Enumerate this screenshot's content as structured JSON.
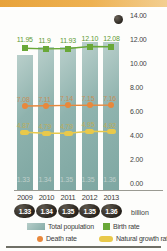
{
  "chart_data": {
    "type": "bar",
    "title": "",
    "xlabel": "",
    "ylabel": "",
    "ylim": [
      0,
      14
    ],
    "grid": false,
    "legend_position": "bottom",
    "categories": [
      "2009",
      "2010",
      "2011",
      "2012",
      "2013"
    ],
    "yticks": [
      "0.00",
      "2.00",
      "4.00",
      "6.00",
      "8.00",
      "10.00",
      "12.00",
      "14.00"
    ],
    "series": [
      {
        "name": "Total population",
        "type": "bar",
        "unit": "billion",
        "values": [
          1.33,
          1.34,
          1.35,
          1.35,
          1.36
        ],
        "labels": [
          "1.33",
          "1.34",
          "1.35",
          "1.35",
          "1.36"
        ]
      },
      {
        "name": "Birth rate",
        "type": "line",
        "values": [
          11.95,
          11.9,
          11.93,
          12.1,
          12.08
        ],
        "labels": [
          "11.95",
          "11.9",
          "11.93",
          "12.10",
          "12.08"
        ]
      },
      {
        "name": "Death rate",
        "type": "line",
        "values": [
          7.08,
          7.11,
          7.14,
          7.15,
          7.16
        ],
        "labels": [
          "7.08",
          "7.11",
          "7.14",
          "7.15",
          "7.16"
        ]
      },
      {
        "name": "Natural growth rate",
        "type": "line",
        "values": [
          4.87,
          4.79,
          4.79,
          4.95,
          4.92
        ],
        "labels": [
          "4.87",
          "4.79",
          "4.79",
          "4.95",
          "4.92"
        ]
      }
    ],
    "colors": {
      "total_population": "#8fb3ae",
      "birth_rate": "#69a838",
      "death_rate": "#e8883c",
      "natural_growth_rate": "#e9c94b",
      "banner": "#e8a33d",
      "axis_text": "#3c3c3c"
    }
  },
  "axis": {
    "unit_label": "billion",
    "marker_icon": "dark-circle-icon"
  },
  "legend": {
    "items": [
      {
        "label": "Total population",
        "swatch": "bar-swatch"
      },
      {
        "label": "Birth rate",
        "swatch": "square-marker-icon"
      },
      {
        "label": "Death rate",
        "swatch": "circle-marker-icon"
      },
      {
        "label": "Natural growth rate",
        "swatch": "pill-marker-icon"
      }
    ]
  }
}
